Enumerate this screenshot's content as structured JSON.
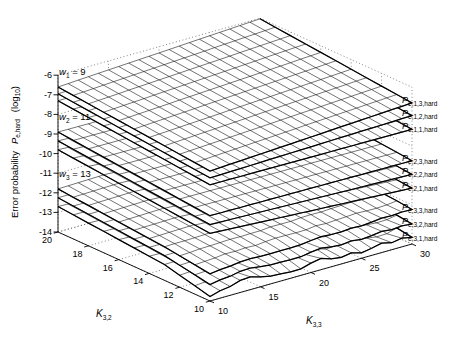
{
  "figure": {
    "background": "#ffffff",
    "line_color": "#000000",
    "grid_color": "#666666"
  },
  "chart_data": {
    "type": "mesh3d",
    "title": "",
    "x_axis": {
      "label_base": "K",
      "label_sub": "3,3",
      "ticks": [
        "10",
        "15",
        "20",
        "25",
        "30"
      ],
      "range": [
        10,
        30
      ]
    },
    "y_axis": {
      "label_base": "K",
      "label_sub": "3,2",
      "ticks": [
        "20",
        "18",
        "16",
        "14",
        "12",
        "10"
      ],
      "range": [
        10,
        20
      ]
    },
    "z_axis": {
      "label_text": "Error probability",
      "label_var": "P",
      "label_var_sub": "e,hard",
      "label_unit_open": "(log",
      "label_unit_sub": "10",
      "label_unit_close": ")",
      "ticks": [
        "-6",
        "-7",
        "-8",
        "-9",
        "-10",
        "-11",
        "-12",
        "-13",
        "-14"
      ],
      "range": [
        -14,
        -6
      ]
    },
    "groups": [
      {
        "label_base": "w",
        "label_sub": "1",
        "label_rest": " = 9"
      },
      {
        "label_base": "w",
        "label_sub": "2",
        "label_rest": " = 11"
      },
      {
        "label_base": "w",
        "label_sub": "3",
        "label_rest": " = 13"
      }
    ],
    "surfaces": [
      {
        "label_base": "P",
        "label_sub": "e,1,3,hard",
        "group": 0,
        "z_left": -6.6,
        "z_right": -6.8,
        "front_drop": 0.77,
        "noise": 0
      },
      {
        "label_base": "P",
        "label_sub": "e,1,2,hard",
        "group": 0,
        "z_left": -6.95,
        "z_right": -7.45,
        "front_drop": 0.77,
        "noise": 0
      },
      {
        "label_base": "P",
        "label_sub": "e,1,1,hard",
        "group": 0,
        "z_left": -7.3,
        "z_right": -8.15,
        "front_drop": 0.77,
        "noise": 0
      },
      {
        "label_base": "P",
        "label_sub": "e,2,3,hard",
        "group": 1,
        "z_left": -8.9,
        "z_right": -9.75,
        "front_drop": 0.75,
        "noise": 0
      },
      {
        "label_base": "P",
        "label_sub": "e,2,2,hard",
        "group": 1,
        "z_left": -9.35,
        "z_right": -10.45,
        "front_drop": 0.75,
        "noise": 0
      },
      {
        "label_base": "P",
        "label_sub": "e,2,1,hard",
        "group": 1,
        "z_left": -9.8,
        "z_right": -11.15,
        "front_drop": 0.75,
        "noise": 0
      },
      {
        "label_base": "P",
        "label_sub": "e,3,3,hard",
        "group": 2,
        "z_left": -11.8,
        "z_right": -12.25,
        "front_drop": 0.7,
        "noise": 0.05
      },
      {
        "label_base": "P",
        "label_sub": "e,3,2,hard",
        "group": 2,
        "z_left": -12.25,
        "z_right": -13.0,
        "front_drop": 0.7,
        "noise": 0.09
      },
      {
        "label_base": "P",
        "label_sub": "e,3,1,hard",
        "group": 2,
        "z_left": -12.7,
        "z_right": -13.7,
        "front_drop": 0.7,
        "noise": 0.16
      }
    ]
  }
}
